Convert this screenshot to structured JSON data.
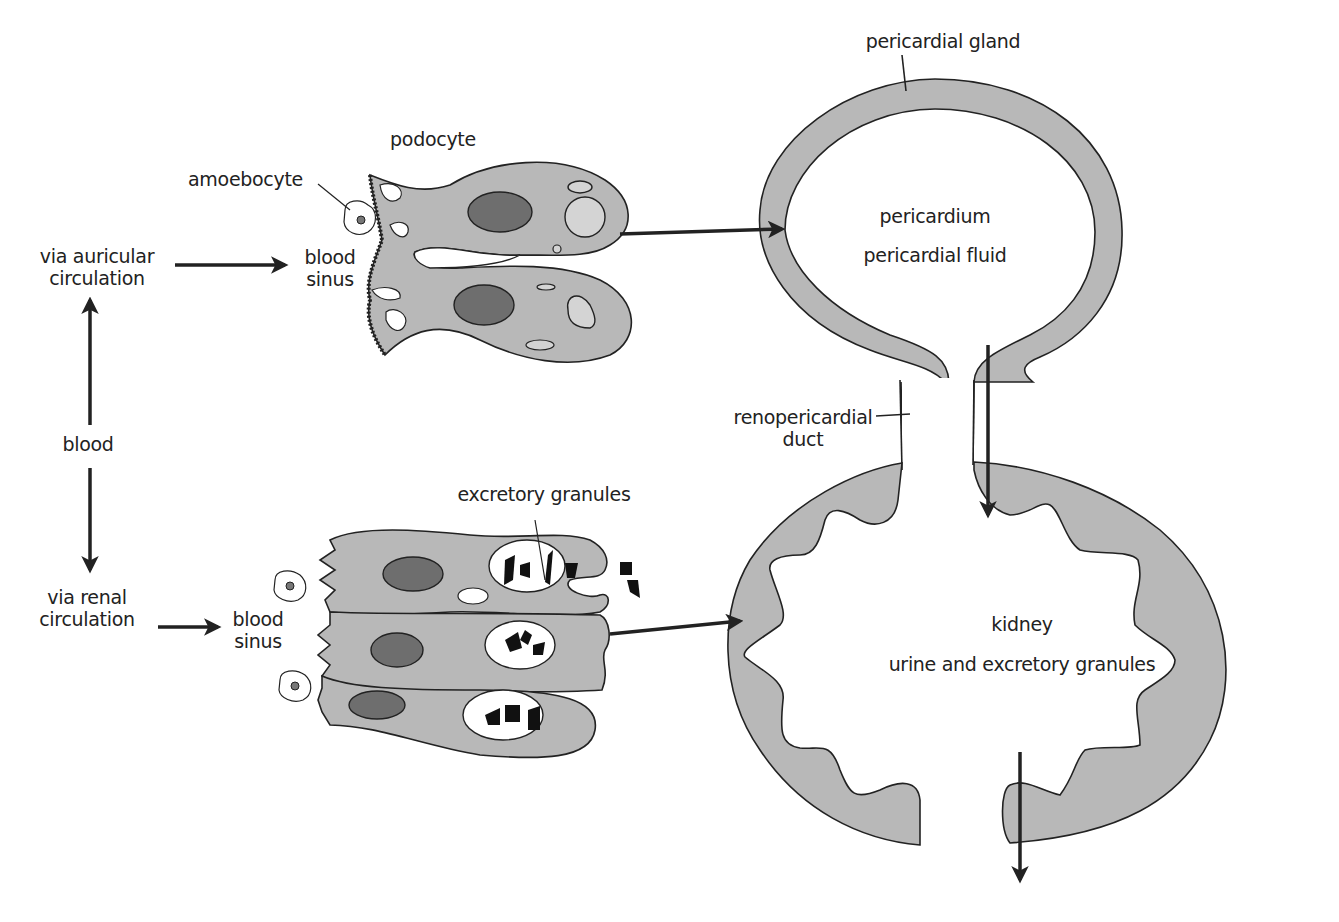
{
  "diagram": {
    "colors": {
      "tissue_fill": "#b8b8b8",
      "nucleus_fill": "#6e6e6e",
      "vacuole_fill": "#d4d4d4",
      "stroke": "#222222",
      "background": "#ffffff"
    },
    "labels": {
      "pericardial_gland": "pericardial gland",
      "podocyte": "podocyte",
      "amoebocyte": "amoebocyte",
      "via_auricular_line1": "via auricular",
      "via_auricular_line2": "circulation",
      "blood_sinus_top_line1": "blood",
      "blood_sinus_top_line2": "sinus",
      "pericardium": "pericardium",
      "pericardial_fluid": "pericardial fluid",
      "blood": "blood",
      "renopericardial_line1": "renopericardial",
      "renopericardial_line2": "duct",
      "excretory_granules": "excretory granules",
      "via_renal_line1": "via renal",
      "via_renal_line2": "circulation",
      "blood_sinus_bottom_line1": "blood",
      "blood_sinus_bottom_line2": "sinus",
      "kidney": "kidney",
      "urine_and_granules": "urine and excretory granules"
    },
    "nodes": [
      {
        "id": "blood",
        "label": "blood"
      },
      {
        "id": "auricular",
        "label": "via auricular circulation"
      },
      {
        "id": "renal",
        "label": "via renal circulation"
      },
      {
        "id": "sinus_top",
        "label": "blood sinus"
      },
      {
        "id": "sinus_bottom",
        "label": "blood sinus"
      },
      {
        "id": "podocyte",
        "label": "podocyte"
      },
      {
        "id": "renal_cells",
        "label": "excretory granules"
      },
      {
        "id": "pericardium",
        "label": "pericardium / pericardial fluid"
      },
      {
        "id": "duct",
        "label": "renopericardial duct"
      },
      {
        "id": "kidney",
        "label": "kidney / urine and excretory granules"
      }
    ],
    "edges": [
      {
        "from": "blood",
        "to": "auricular"
      },
      {
        "from": "blood",
        "to": "renal"
      },
      {
        "from": "auricular",
        "to": "sinus_top"
      },
      {
        "from": "renal",
        "to": "sinus_bottom"
      },
      {
        "from": "podocyte",
        "to": "pericardium"
      },
      {
        "from": "renal_cells",
        "to": "kidney"
      },
      {
        "from": "pericardium",
        "to": "kidney",
        "via": "duct"
      },
      {
        "from": "kidney",
        "to": "exterior"
      }
    ]
  }
}
